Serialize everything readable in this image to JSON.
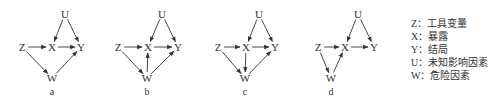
{
  "diagrams": [
    {
      "label": "a",
      "nodes": {
        "U": [
          65,
          14
        ],
        "Z": [
          22,
          47
        ],
        "X": [
          52,
          47
        ],
        "Y": [
          81,
          47
        ],
        "W": [
          52,
          78
        ]
      },
      "edges": [
        [
          "U",
          "X"
        ],
        [
          "U",
          "Y"
        ],
        [
          "Z",
          "X"
        ],
        [
          "X",
          "Y"
        ],
        [
          "Z",
          "W"
        ],
        [
          "W",
          "Y"
        ]
      ],
      "label_pos": [
        52,
        92
      ]
    },
    {
      "label": "b",
      "nodes": {
        "U": [
          162,
          14
        ],
        "Z": [
          118,
          47
        ],
        "X": [
          148,
          47
        ],
        "Y": [
          178,
          47
        ],
        "W": [
          147,
          78
        ]
      },
      "edges": [
        [
          "U",
          "X"
        ],
        [
          "U",
          "Y"
        ],
        [
          "Z",
          "X"
        ],
        [
          "X",
          "Y"
        ],
        [
          "Z",
          "W"
        ],
        [
          "W",
          "X"
        ],
        [
          "W",
          "Y"
        ]
      ],
      "label_pos": [
        147,
        92
      ]
    },
    {
      "label": "c",
      "nodes": {
        "U": [
          259,
          14
        ],
        "Z": [
          218,
          47
        ],
        "X": [
          246,
          47
        ],
        "Y": [
          275,
          47
        ],
        "W": [
          245,
          78
        ]
      },
      "edges": [
        [
          "U",
          "X"
        ],
        [
          "U",
          "Y"
        ],
        [
          "Z",
          "X"
        ],
        [
          "X",
          "Y"
        ],
        [
          "Z",
          "W"
        ],
        [
          "X",
          "W"
        ],
        [
          "W",
          "Y"
        ]
      ],
      "label_pos": [
        245,
        92
      ]
    },
    {
      "label": "d",
      "nodes": {
        "U": [
          358,
          14
        ],
        "Z": [
          318,
          47
        ],
        "X": [
          345,
          47
        ],
        "Y": [
          374,
          47
        ],
        "W": [
          331,
          78
        ]
      },
      "edges": [
        [
          "U",
          "X"
        ],
        [
          "U",
          "Y"
        ],
        [
          "Z",
          "X"
        ],
        [
          "X",
          "Y"
        ],
        [
          "Z",
          "W"
        ],
        [
          "W",
          "X"
        ]
      ],
      "label_pos": [
        331,
        92
      ]
    }
  ],
  "legend": [
    {
      "key": "Z",
      "sep": "：",
      "text": "工具变量"
    },
    {
      "key": "X",
      "sep": "：",
      "text": "暴露"
    },
    {
      "key": "Y",
      "sep": "：",
      "text": "结局"
    },
    {
      "key": "U",
      "sep": "：",
      "text": "未知影响因素"
    },
    {
      "key": "W",
      "sep": "：",
      "text": "危险因素"
    }
  ],
  "colors": {
    "ink": "#333333",
    "background": "#ffffff"
  }
}
